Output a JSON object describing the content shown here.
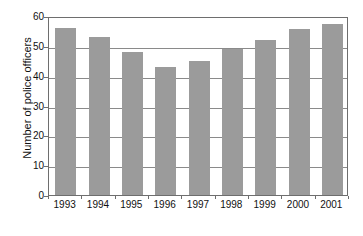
{
  "chart_data": {
    "type": "bar",
    "title": "",
    "xlabel": "",
    "ylabel": "Number of police officers",
    "categories": [
      "1993",
      "1994",
      "1995",
      "1996",
      "1997",
      "1998",
      "1999",
      "2000",
      "2001"
    ],
    "values": [
      56,
      53,
      48,
      43,
      45,
      49,
      52,
      55.5,
      57.5
    ],
    "ylim": [
      0,
      60
    ],
    "yticks": [
      "0",
      "10",
      "20",
      "30",
      "40",
      "50",
      "60"
    ],
    "ytick_values": [
      0,
      10,
      20,
      30,
      40,
      50,
      60
    ],
    "grid": "horizontal",
    "legend": "none",
    "bar_color": "#9b9b9b",
    "axis_color": "#6e6e6e",
    "gridline_color": "#8a8a8a",
    "background_color": "#ffffff"
  }
}
